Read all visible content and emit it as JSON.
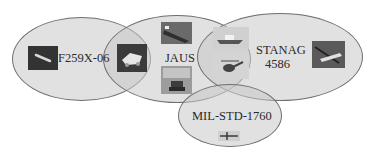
{
  "diagram": {
    "type": "venn",
    "sets": [
      {
        "id": "f259x",
        "label": "F259X-06"
      },
      {
        "id": "jaus",
        "label": "JAUS"
      },
      {
        "id": "stanag",
        "label_line1": "STANAG",
        "label_line2": "4586"
      },
      {
        "id": "milstd",
        "label": "MIL-STD-1760"
      }
    ],
    "images": [
      {
        "name": "missile-image",
        "set": "F259X-06"
      },
      {
        "name": "ground-robot-image",
        "set": "F259X-06 ∩ JAUS"
      },
      {
        "name": "ship-image",
        "set": "JAUS"
      },
      {
        "name": "tracked-robot-image",
        "set": "JAUS"
      },
      {
        "name": "boat-image",
        "set": "JAUS ∩ STANAG 4586"
      },
      {
        "name": "helicopter-image",
        "set": "JAUS ∩ STANAG 4586"
      },
      {
        "name": "uav-image",
        "set": "STANAG 4586"
      },
      {
        "name": "aircraft-image",
        "set": "MIL-STD-1760"
      }
    ],
    "colors": {
      "fill": "#c8c8c8",
      "stroke": "#6e6e6e",
      "text": "#2a2a2a"
    }
  }
}
